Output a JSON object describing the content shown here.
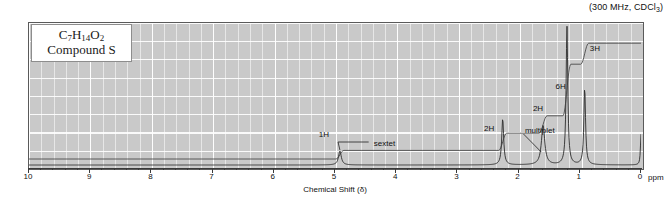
{
  "instrument": {
    "label": "(300 MHz, CDCl",
    "subscript": "3",
    "label_end": ")"
  },
  "compound": {
    "formula_parts": [
      "C",
      "7",
      "H",
      "14",
      "O",
      "2"
    ],
    "name": "Compound S"
  },
  "axis": {
    "title": "Chemical Shift (δ)",
    "unit": "ppm",
    "ticks": [
      10,
      9,
      8,
      7,
      6,
      5,
      4,
      3,
      2,
      1,
      0
    ],
    "min": 0,
    "max": 10
  },
  "annotations": [
    {
      "name": "sextet-integration",
      "text": "1H",
      "shift": 5.25,
      "y": 130
    },
    {
      "name": "sextet-label",
      "text": "sextet",
      "shift": 4.35,
      "y": 139
    },
    {
      "name": "ch2-integration",
      "text": "2H",
      "shift": 2.55,
      "y": 124
    },
    {
      "name": "multiplet-label",
      "text": "multiplet",
      "shift": 1.88,
      "y": 126
    },
    {
      "name": "ch2b-integration",
      "text": "2H",
      "shift": 1.75,
      "y": 104
    },
    {
      "name": "six-h-integration",
      "text": "6H",
      "shift": 1.38,
      "y": 82
    },
    {
      "name": "three-h-integration",
      "text": "3H",
      "shift": 0.82,
      "y": 44
    }
  ],
  "chart_data": {
    "type": "line",
    "xlabel": "Chemical Shift (δ)",
    "ylabel": "",
    "xlim": [
      10,
      0
    ],
    "x_unit": "ppm",
    "grid": true,
    "legend": "none",
    "series": [
      {
        "name": "spectrum",
        "peaks": [
          {
            "shift": 4.92,
            "height": 0.1,
            "width": 0.05,
            "multiplicity": "sextet",
            "protons": 1,
            "label": "1H"
          },
          {
            "shift": 2.26,
            "height": 0.33,
            "width": 0.035,
            "multiplicity": "triplet",
            "protons": 2,
            "label": "2H"
          },
          {
            "shift": 1.6,
            "height": 0.28,
            "width": 0.06,
            "multiplicity": "multiplet",
            "protons": 2,
            "label": "2H"
          },
          {
            "shift": 1.21,
            "height": 0.99,
            "width": 0.03,
            "multiplicity": "doublet",
            "protons": 6,
            "label": "6H"
          },
          {
            "shift": 0.92,
            "height": 0.55,
            "width": 0.03,
            "multiplicity": "triplet",
            "protons": 3,
            "label": "3H"
          },
          {
            "shift": 0.0,
            "height": 0.22,
            "width": 0.02,
            "multiplicity": "singlet",
            "protons": 0,
            "label": "TMS"
          }
        ]
      },
      {
        "name": "integral-trace",
        "steps": [
          {
            "shift": 10.0,
            "level": 0.0
          },
          {
            "shift": 4.92,
            "level": 0.072
          },
          {
            "shift": 2.26,
            "level": 0.215
          },
          {
            "shift": 1.6,
            "level": 0.36
          },
          {
            "shift": 1.21,
            "level": 0.79
          },
          {
            "shift": 0.92,
            "level": 0.965
          },
          {
            "shift": 0.0,
            "level": 0.965
          }
        ]
      }
    ]
  }
}
